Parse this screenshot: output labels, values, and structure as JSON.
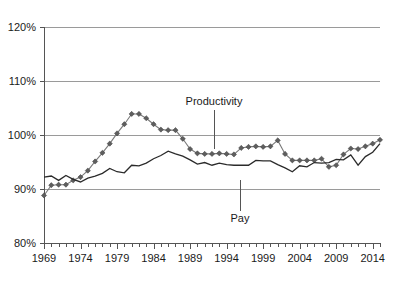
{
  "chart_data": {
    "type": "line",
    "title": "",
    "subtitle": "",
    "xlabel": "",
    "ylabel": "",
    "xlim": [
      1969,
      2015
    ],
    "ylim": [
      80,
      120
    ],
    "grid": true,
    "legend_position": "inline-annotation",
    "y_ticks": [
      80,
      90,
      100,
      110,
      120
    ],
    "y_tick_labels": [
      "80%",
      "90%",
      "100%",
      "110%",
      "120%"
    ],
    "x_ticks": [
      1969,
      1974,
      1979,
      1984,
      1989,
      1994,
      1999,
      2004,
      2009,
      2014
    ],
    "x_tick_labels": [
      "1969",
      "1974",
      "1979",
      "1984",
      "1989",
      "1994",
      "1999",
      "2004",
      "2009",
      "2014"
    ],
    "x_minor_tick_interval": 1,
    "x": [
      1969,
      1970,
      1971,
      1972,
      1973,
      1974,
      1975,
      1976,
      1977,
      1978,
      1979,
      1980,
      1981,
      1982,
      1983,
      1984,
      1985,
      1986,
      1987,
      1988,
      1989,
      1990,
      1991,
      1992,
      1993,
      1994,
      1995,
      1996,
      1997,
      1998,
      1999,
      2000,
      2001,
      2002,
      2003,
      2004,
      2005,
      2006,
      2007,
      2008,
      2009,
      2010,
      2011,
      2012,
      2013,
      2014,
      2015
    ],
    "series": [
      {
        "name": "Productivity",
        "marker": "diamond",
        "color": "#5e5e5e",
        "values": [
          88.8,
          90.7,
          90.8,
          90.8,
          91.6,
          92.2,
          93.4,
          95.1,
          96.7,
          98.4,
          100.3,
          102.0,
          103.9,
          103.9,
          103.1,
          102.0,
          101.0,
          100.9,
          100.9,
          99.3,
          97.4,
          96.6,
          96.5,
          96.5,
          96.6,
          96.5,
          96.4,
          97.6,
          97.8,
          97.9,
          97.8,
          97.9,
          99.0,
          96.5,
          95.3,
          95.3,
          95.3,
          95.3,
          95.6,
          94.1,
          94.4,
          96.4,
          97.5,
          97.4,
          97.9,
          98.4,
          99.1
        ]
      },
      {
        "name": "Pay",
        "marker": "none",
        "color": "#2b2b2b",
        "values": [
          92.2,
          92.4,
          91.6,
          92.5,
          91.8,
          91.3,
          92.0,
          92.4,
          92.9,
          93.8,
          93.2,
          93.0,
          94.4,
          94.3,
          94.8,
          95.6,
          96.2,
          97.0,
          96.5,
          96.1,
          95.4,
          94.6,
          94.9,
          94.4,
          94.8,
          94.5,
          94.4,
          94.4,
          94.4,
          95.3,
          95.2,
          95.2,
          94.5,
          93.9,
          93.2,
          94.3,
          94.1,
          94.9,
          94.8,
          94.9,
          95.5,
          95.4,
          96.3,
          94.4,
          96.0,
          96.8,
          98.4
        ]
      }
    ],
    "annotations": [
      {
        "text": "Productivity",
        "label_x": 214,
        "label_y": 105,
        "leader_x": 214,
        "leader_y1": 110,
        "leader_y2": 149
      },
      {
        "text": "Pay",
        "label_x": 240,
        "label_y": 222,
        "leader_x": 240,
        "leader_y1": 180,
        "leader_y2": 211
      }
    ]
  },
  "plot_geometry": {
    "left": 44,
    "right": 380,
    "top": 27,
    "bottom": 243
  },
  "colors": {
    "grid": "#9a9a9a",
    "axis": "#555555",
    "productivity": "#5e5e5e",
    "pay": "#2b2b2b",
    "background": "#ffffff"
  }
}
